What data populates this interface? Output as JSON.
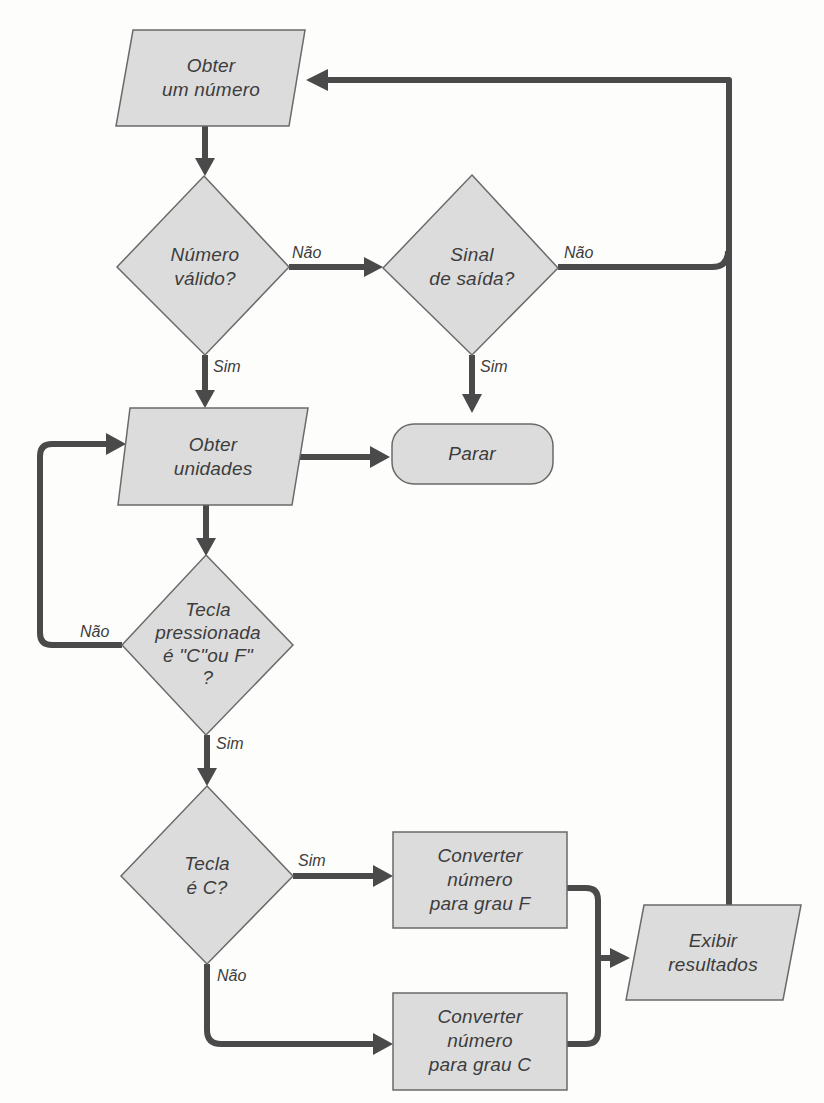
{
  "diagram": {
    "type": "flowchart",
    "colors": {
      "shape_fill": "#dcdcdc",
      "shape_stroke": "#6a6a6a",
      "connector": "#4a4a4a",
      "text": "#3d3d3d",
      "background": "#fdfdfc"
    },
    "nodes": {
      "obter_numero": {
        "shape": "parallelogram",
        "lines": [
          "Obter",
          "um número"
        ]
      },
      "numero_valido": {
        "shape": "diamond",
        "lines": [
          "Número",
          "válido?"
        ]
      },
      "sinal_saida": {
        "shape": "diamond",
        "lines": [
          "Sinal",
          "de saída?"
        ]
      },
      "obter_unidades": {
        "shape": "parallelogram",
        "lines": [
          "Obter",
          "unidades"
        ]
      },
      "parar": {
        "shape": "terminator",
        "lines": [
          "Parar"
        ]
      },
      "tecla_pressionada": {
        "shape": "diamond",
        "lines": [
          "Tecla",
          "pressionada",
          "é \"C\"ou F\"",
          "?"
        ]
      },
      "tecla_c": {
        "shape": "diamond",
        "lines": [
          "Tecla",
          "é C?"
        ]
      },
      "converter_f": {
        "shape": "rectangle",
        "lines": [
          "Converter",
          "número",
          "para grau F"
        ]
      },
      "converter_c": {
        "shape": "rectangle",
        "lines": [
          "Converter",
          "número",
          "para grau C"
        ]
      },
      "exibir": {
        "shape": "parallelogram",
        "lines": [
          "Exibir",
          "resultados"
        ]
      }
    },
    "edges": [
      {
        "from": "obter_numero",
        "to": "numero_valido",
        "label": ""
      },
      {
        "from": "numero_valido",
        "to": "sinal_saida",
        "label": "Não"
      },
      {
        "from": "numero_valido",
        "to": "obter_unidades",
        "label": "Sim"
      },
      {
        "from": "sinal_saida",
        "to": "obter_numero",
        "label": "Não"
      },
      {
        "from": "sinal_saida",
        "to": "parar",
        "label": "Sim"
      },
      {
        "from": "obter_unidades",
        "to": "parar",
        "label": ""
      },
      {
        "from": "obter_unidades",
        "to": "tecla_pressionada",
        "label": ""
      },
      {
        "from": "tecla_pressionada",
        "to": "obter_unidades",
        "label": "Não"
      },
      {
        "from": "tecla_pressionada",
        "to": "tecla_c",
        "label": "Sim"
      },
      {
        "from": "tecla_c",
        "to": "converter_f",
        "label": "Sim"
      },
      {
        "from": "tecla_c",
        "to": "converter_c",
        "label": "Não"
      },
      {
        "from": "converter_f",
        "to": "exibir",
        "label": ""
      },
      {
        "from": "converter_c",
        "to": "exibir",
        "label": ""
      },
      {
        "from": "exibir",
        "to": "obter_numero",
        "label": ""
      }
    ],
    "edge_labels": {
      "numero_valido_nao": "Não",
      "numero_valido_sim": "Sim",
      "sinal_saida_nao": "Não",
      "sinal_saida_sim": "Sim",
      "tecla_pressionada_nao": "Não",
      "tecla_pressionada_sim": "Sim",
      "tecla_c_sim": "Sim",
      "tecla_c_nao": "Não"
    }
  }
}
